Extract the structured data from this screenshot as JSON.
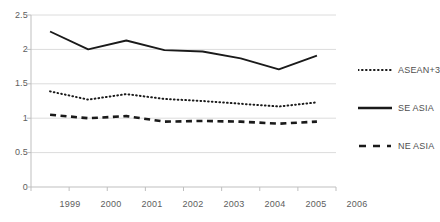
{
  "chart_data": {
    "type": "line",
    "title": "",
    "xlabel": "",
    "ylabel": "",
    "categories": [
      "1999",
      "2000",
      "2001",
      "2002",
      "2003",
      "2004",
      "2005",
      "2006"
    ],
    "ylim": [
      0,
      2.5
    ],
    "y_ticks": [
      "0",
      "0.5",
      "1",
      "1.5",
      "2",
      "2.5"
    ],
    "y_tick_values": [
      0,
      0.5,
      1,
      1.5,
      2,
      2.5
    ],
    "grid": "horizontal",
    "legend_position": "right",
    "series": [
      {
        "name": "ASEAN+3",
        "style": "dotted",
        "color": "#1a1a1a",
        "values": [
          1.39,
          1.27,
          1.35,
          1.28,
          1.25,
          1.21,
          1.17,
          1.23
        ]
      },
      {
        "name": "SE ASIA",
        "style": "solid",
        "color": "#1a1a1a",
        "values": [
          2.26,
          2.0,
          2.13,
          1.99,
          1.97,
          1.87,
          1.71,
          1.91
        ]
      },
      {
        "name": "NE ASIA",
        "style": "dashed",
        "color": "#1a1a1a",
        "values": [
          1.05,
          1.0,
          1.03,
          0.95,
          0.96,
          0.95,
          0.92,
          0.95
        ]
      }
    ]
  },
  "legend": {
    "items": [
      {
        "label": "ASEAN+3"
      },
      {
        "label": "SE ASIA"
      },
      {
        "label": "NE ASIA"
      }
    ]
  },
  "axes": {
    "y_ticks": [
      {
        "label": "2.5"
      },
      {
        "label": "2"
      },
      {
        "label": "1.5"
      },
      {
        "label": "1"
      },
      {
        "label": "0.5"
      },
      {
        "label": "0"
      }
    ],
    "x_ticks": [
      {
        "label": "1999"
      },
      {
        "label": "2000"
      },
      {
        "label": "2001"
      },
      {
        "label": "2002"
      },
      {
        "label": "2003"
      },
      {
        "label": "2004"
      },
      {
        "label": "2005"
      },
      {
        "label": "2006"
      }
    ]
  },
  "colors": {
    "line": "#1a1a1a",
    "grid": "#dcdcdc",
    "axis": "#bfbfbf",
    "text": "#5d5d5d",
    "background": "#ffffff"
  }
}
